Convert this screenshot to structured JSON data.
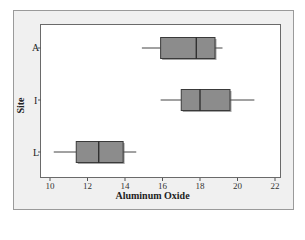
{
  "chart_data": {
    "type": "boxplot",
    "orientation": "horizontal",
    "title": "",
    "xlabel": "Aluminum Oxide",
    "ylabel": "Site",
    "xlim": [
      9.5,
      22.2
    ],
    "xticks": [
      10,
      12,
      14,
      16,
      18,
      20,
      22
    ],
    "grid": false,
    "legend": null,
    "categories": [
      "A",
      "I",
      "L"
    ],
    "series": [
      {
        "name": "A",
        "whisker_low": 14.9,
        "q1": 15.9,
        "median": 17.8,
        "q3": 18.8,
        "whisker_high": 19.2
      },
      {
        "name": "I",
        "whisker_low": 15.9,
        "q1": 17.0,
        "median": 18.0,
        "q3": 19.6,
        "whisker_high": 20.9
      },
      {
        "name": "L",
        "whisker_low": 10.2,
        "q1": 11.4,
        "median": 12.6,
        "q3": 13.9,
        "whisker_high": 14.6
      }
    ],
    "colors": {
      "box_fill": "#8c8c8c",
      "box_edge": "#3a3a3a",
      "whisker": "#444444",
      "frame_bg": "#f0f0f0",
      "plot_bg": "#ffffff"
    }
  }
}
